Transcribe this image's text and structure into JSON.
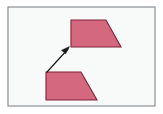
{
  "figure": {
    "background_color": "#ffffff",
    "canvas": {
      "width": 163,
      "height": 114,
      "inner_background_color": "#f8f9f9"
    },
    "frame": {
      "name": "figure-border",
      "x": 8,
      "y": 7,
      "width": 147,
      "height": 99,
      "stroke_color": "#8c9093",
      "stroke_width": 1.2
    },
    "shapes": [
      {
        "id": "preimage-trapezoid",
        "label": "lower trapezoid",
        "role": "preimage",
        "fill_color": "#d4687f",
        "stroke_color": "#7e2336",
        "stroke_width": 1.1,
        "points": "46,72 81,72 97,100 46,100"
      },
      {
        "id": "image-trapezoid",
        "label": "upper trapezoid",
        "role": "image",
        "fill_color": "#d4687f",
        "stroke_color": "#7e2336",
        "stroke_width": 1.1,
        "points": "71,20 106,20 121,47 71,47"
      }
    ],
    "arrow": {
      "id": "translation-arrow",
      "label": "translation vector",
      "stroke_color": "#1a1a1a",
      "stroke_width": 1.2,
      "tail": {
        "x": 47,
        "y": 72
      },
      "head": {
        "x": 69,
        "y": 47
      },
      "head_polygon": "69,47 62,50 65,53"
    }
  }
}
